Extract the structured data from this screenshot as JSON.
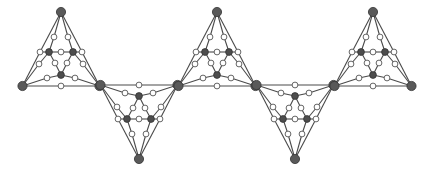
{
  "diagram": {
    "type": "graph-chain",
    "colors": {
      "edge": "#4a4a4a",
      "white_node_fill": "#ffffff",
      "white_node_stroke": "#555555",
      "dark_node_fill": "#4d4d4d",
      "outer_node_fill": "#595959"
    },
    "mirror_axis_sum": 171,
    "triangles": [
      {
        "cx": 61,
        "orientation": "up"
      },
      {
        "cx": 139,
        "orientation": "down"
      },
      {
        "cx": 217,
        "orientation": "up"
      },
      {
        "cx": 295,
        "orientation": "down"
      },
      {
        "cx": 373,
        "orientation": "up"
      }
    ],
    "template": {
      "nodes": {
        "T": {
          "dx": 0,
          "y": 12,
          "kind": "outer"
        },
        "L": {
          "dx": -38.5,
          "y": 86,
          "kind": "outer"
        },
        "R": {
          "dx": 38.5,
          "y": 86,
          "kind": "outer"
        },
        "A": {
          "dx": -12,
          "y": 52,
          "kind": "dark"
        },
        "B": {
          "dx": 12,
          "y": 52,
          "kind": "dark"
        },
        "C": {
          "dx": 0,
          "y": 75,
          "kind": "dark"
        },
        "wTA": {
          "dx": -7,
          "y": 37,
          "kind": "white"
        },
        "wTB": {
          "dx": 7,
          "y": 37,
          "kind": "white"
        },
        "wAB": {
          "dx": 0,
          "y": 52,
          "kind": "white"
        },
        "wTL": {
          "dx": -21,
          "y": 52,
          "kind": "white"
        },
        "wTR": {
          "dx": 21,
          "y": 52,
          "kind": "white"
        },
        "wLA": {
          "dx": -22,
          "y": 64,
          "kind": "white"
        },
        "wRB": {
          "dx": 22,
          "y": 64,
          "kind": "white"
        },
        "wAC": {
          "dx": -6,
          "y": 63,
          "kind": "white"
        },
        "wBC": {
          "dx": 6,
          "y": 63,
          "kind": "white"
        },
        "wLC": {
          "dx": -14,
          "y": 78,
          "kind": "white"
        },
        "wRC": {
          "dx": 14,
          "y": 78,
          "kind": "white"
        },
        "wLR": {
          "dx": 0,
          "y": 86,
          "kind": "white"
        }
      },
      "edges": [
        [
          "T",
          "wTL"
        ],
        [
          "wTL",
          "L"
        ],
        [
          "T",
          "wTR"
        ],
        [
          "wTR",
          "R"
        ],
        [
          "L",
          "wLR"
        ],
        [
          "wLR",
          "R"
        ],
        [
          "T",
          "wTA"
        ],
        [
          "wTA",
          "A"
        ],
        [
          "T",
          "wTB"
        ],
        [
          "wTB",
          "B"
        ],
        [
          "A",
          "wAB"
        ],
        [
          "wAB",
          "B"
        ],
        [
          "A",
          "wTL"
        ],
        [
          "B",
          "wTR"
        ],
        [
          "L",
          "wLA"
        ],
        [
          "wLA",
          "A"
        ],
        [
          "R",
          "wRB"
        ],
        [
          "wRB",
          "B"
        ],
        [
          "A",
          "wAC"
        ],
        [
          "wAC",
          "C"
        ],
        [
          "B",
          "wBC"
        ],
        [
          "wBC",
          "C"
        ],
        [
          "L",
          "wLC"
        ],
        [
          "wLC",
          "C"
        ],
        [
          "R",
          "wRC"
        ],
        [
          "wRC",
          "C"
        ]
      ]
    }
  }
}
